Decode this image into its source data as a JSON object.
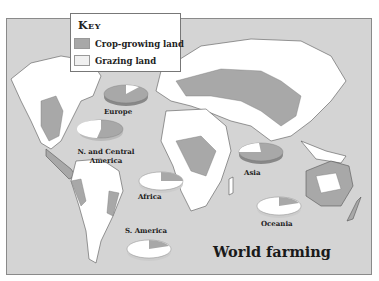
{
  "key": {
    "title": "Key",
    "items": [
      {
        "label": "Crop-growing land",
        "color": "#a8a8a8"
      },
      {
        "label": "Grazing land",
        "color": "#f0f0f0"
      }
    ]
  },
  "map": {
    "title": "World farming",
    "ocean_color": "#d4d4d4",
    "land_color": "#ffffff",
    "crop_color": "#a8a8a8"
  },
  "regions": [
    {
      "label": "Europe",
      "crop_share": 0.85
    },
    {
      "label": "N. and Central America",
      "crop_share": 0.5
    },
    {
      "label": "Asia",
      "crop_share": 0.75
    },
    {
      "label": "Africa",
      "crop_share": 0.25
    },
    {
      "label": "S. America",
      "crop_share": 0.2
    },
    {
      "label": "Oceania",
      "crop_share": 0.2
    }
  ]
}
